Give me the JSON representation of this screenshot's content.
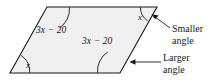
{
  "figure": {
    "name": "parallelogram-angle-diagram",
    "shape": {
      "type": "parallelogram",
      "fill_color": "#f0f0f0",
      "stroke_color": "#1a1a1a",
      "vertices": [
        {
          "name": "bottom-left",
          "x": 10,
          "y": 73
        },
        {
          "name": "bottom-right",
          "x": 120,
          "y": 73
        },
        {
          "name": "top-right",
          "x": 157,
          "y": 7
        },
        {
          "name": "top-left",
          "x": 47,
          "y": 7
        }
      ]
    },
    "angle_labels": [
      {
        "id": "top-left-angle",
        "text": "3x − 20",
        "vertex": "top-left",
        "arc": "large"
      },
      {
        "id": "bottom-right-angle",
        "text": "3x − 20",
        "vertex": "bottom-right",
        "arc": "large"
      },
      {
        "id": "top-right-angle",
        "text": "x",
        "vertex": "top-right",
        "arc": "small"
      },
      {
        "id": "bottom-left-angle",
        "text": "x",
        "vertex": "bottom-left",
        "arc": "small"
      }
    ],
    "callouts": [
      {
        "id": "smaller-angle-callout",
        "line1": "Smaller",
        "line2": "angle",
        "points_to": "top-right-angle"
      },
      {
        "id": "larger-angle-callout",
        "line1": "Larger",
        "line2": "angle",
        "points_to": "bottom-right-angle"
      }
    ]
  }
}
